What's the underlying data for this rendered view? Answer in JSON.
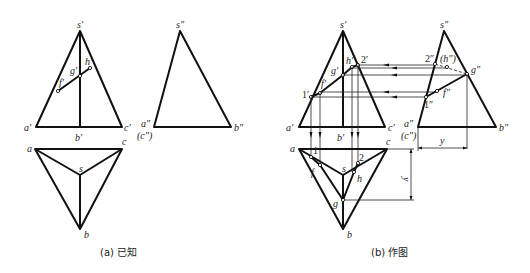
{
  "figure": {
    "panels": [
      {
        "id": "a",
        "caption": "(a) 已知",
        "front_view_labels": {
          "s": "s′",
          "a": "a′",
          "b": "b′",
          "c": "c′",
          "f": "f′",
          "g": "g′",
          "h": "h′"
        },
        "side_view_labels": {
          "s": "s″",
          "a": "a″",
          "c": "(c″)",
          "b": "b″"
        },
        "top_view_labels": {
          "a": "a",
          "c": "c",
          "s": "s",
          "b": "b"
        }
      },
      {
        "id": "b",
        "caption": "(b) 作图",
        "front_view_labels": {
          "s": "s′",
          "a": "a′",
          "b": "b′",
          "c": "c′",
          "p1": "1′",
          "f": "f′",
          "g": "g′",
          "h": "h′",
          "p2": "2′"
        },
        "side_view_labels": {
          "s": "s″",
          "a": "a″",
          "c": "(c″)",
          "b": "b″",
          "p2": "2″",
          "h": "(h″)",
          "g": "g″",
          "p1": "1″",
          "f": "f″"
        },
        "top_view_labels": {
          "a": "a",
          "c": "c",
          "s": "s",
          "b": "b",
          "p1": "1",
          "f": "f",
          "p2": "2",
          "h": "h",
          "g": "g"
        },
        "dimensions": {
          "y_top": "y",
          "y_side": "y"
        }
      }
    ]
  }
}
